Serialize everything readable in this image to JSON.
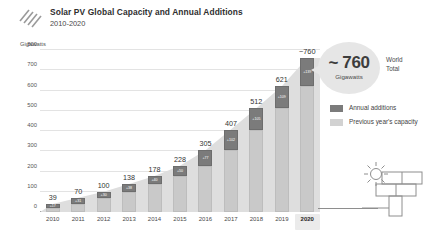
{
  "header": {
    "logo_icon": "striped-panel-logo",
    "title": "Solar PV Global Capacity and Annual Additions",
    "subtitle": "2010-2020"
  },
  "callout": {
    "value": "~ 760",
    "unit": "Gigawatts",
    "side_label_line1": "World",
    "side_label_line2": "Total"
  },
  "legend": {
    "items": [
      {
        "label": "Annual additions",
        "color": "#7b7b7b"
      },
      {
        "label": "Previous year's capacity",
        "color": "#d2d2d2"
      }
    ]
  },
  "icons": {
    "solar_panel_sun": "sun-solar-panel-icon"
  },
  "chart_data": {
    "type": "bar",
    "title": "Solar PV Global Capacity and Annual Additions",
    "subtitle": "2010-2020",
    "xlabel": "",
    "ylabel": "Gigawatts",
    "ylim": [
      0,
      800
    ],
    "yticks": [
      0,
      100,
      200,
      300,
      400,
      500,
      600,
      700,
      800
    ],
    "ytick_labels": [
      "0",
      "100",
      "200",
      "300",
      "400",
      "500",
      "600",
      "700",
      "800"
    ],
    "grid": true,
    "legend_position": "right",
    "stacked": true,
    "categories": [
      "2010",
      "2011",
      "2012",
      "2013",
      "2014",
      "2015",
      "2016",
      "2017",
      "2018",
      "2019",
      "2020"
    ],
    "total_labels": [
      "39",
      "70",
      "100",
      "138",
      "178",
      "228",
      "305",
      "407",
      "512",
      "621",
      "~760"
    ],
    "totals": [
      39,
      70,
      100,
      138,
      178,
      228,
      305,
      407,
      512,
      621,
      760
    ],
    "series": [
      {
        "name": "Previous year's capacity",
        "color": "#c9c9c9",
        "values": [
          22,
          39,
          70,
          100,
          138,
          178,
          228,
          305,
          407,
          512,
          621
        ]
      },
      {
        "name": "Annual additions",
        "color": "#7b7b7b",
        "values": [
          17,
          31,
          30,
          38,
          40,
          50,
          77,
          102,
          105,
          109,
          139
        ],
        "labels": [
          "+17",
          "+31",
          "+30",
          "+38",
          "+40",
          "+50",
          "+77",
          "+102",
          "+105",
          "+109",
          "+139"
        ]
      }
    ],
    "highlighted_category": "2020"
  }
}
